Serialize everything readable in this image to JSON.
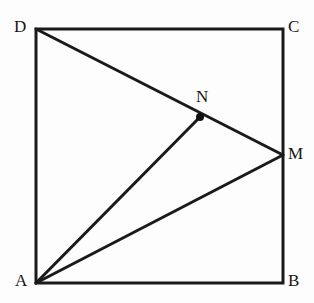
{
  "figure": {
    "kind": "plane-geometry-diagram",
    "background_color": "#fdfdfd",
    "stroke_color": "#1a1a1a",
    "square_stroke_width": 3,
    "segment_stroke_width": 3,
    "point_marker_color": "#111111",
    "point_marker_radius": 4
  },
  "points": {
    "A": {
      "label": "A",
      "x": 36,
      "y": 283,
      "label_x": 15,
      "label_y": 272,
      "marked": false
    },
    "B": {
      "label": "B",
      "x": 283,
      "y": 283,
      "label_x": 288,
      "label_y": 272,
      "marked": false
    },
    "C": {
      "label": "C",
      "x": 283,
      "y": 29,
      "label_x": 288,
      "label_y": 18,
      "marked": false
    },
    "D": {
      "label": "D",
      "x": 36,
      "y": 29,
      "label_x": 14,
      "label_y": 18,
      "marked": false
    },
    "M": {
      "label": "M",
      "x": 283,
      "y": 155,
      "label_x": 288,
      "label_y": 145,
      "marked": false
    },
    "N": {
      "label": "N",
      "x": 200,
      "y": 117,
      "label_x": 196,
      "label_y": 88,
      "marked": true
    }
  },
  "square": {
    "name": "ABCD",
    "sides": [
      {
        "name": "AB",
        "from": "A",
        "to": "B"
      },
      {
        "name": "BC",
        "from": "B",
        "to": "C"
      },
      {
        "name": "CD",
        "from": "C",
        "to": "D"
      },
      {
        "name": "DA",
        "from": "D",
        "to": "A"
      }
    ],
    "path": "M 36 283 L 283 283 L 283 29 L 36 29 Z"
  },
  "segments": [
    {
      "name": "DM",
      "from": "D",
      "to": "M",
      "path": "M 36 29 L 283 155",
      "note": "passes through N"
    },
    {
      "name": "AN",
      "from": "A",
      "to": "N",
      "path": "M 36 283 L 200 117"
    },
    {
      "name": "AM",
      "from": "A",
      "to": "M",
      "path": "M 36 283 L 283 155"
    }
  ]
}
